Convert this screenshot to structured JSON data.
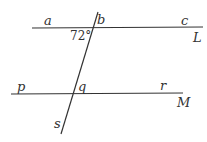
{
  "diagram": {
    "lines": {
      "L": {
        "label": "L"
      },
      "M": {
        "label": "M"
      },
      "transversal": {
        "label": "s"
      }
    },
    "points": {
      "a": "a",
      "b": "b",
      "c": "c",
      "p": "p",
      "q": "q",
      "r": "r",
      "s": "s"
    },
    "angle": {
      "value": "72°"
    },
    "line_color": "#333333"
  }
}
